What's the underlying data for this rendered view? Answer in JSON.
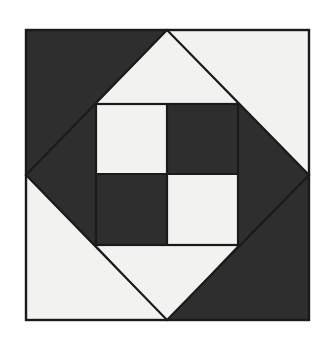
{
  "figure": {
    "title": "Square-in-a-Square Quilt Block with Four-Patch Center",
    "canvas": {
      "width": 331,
      "height": 345,
      "background": "#ffffff"
    }
  },
  "palette": {
    "dark": "#2e2e2e",
    "light": "#f2f2f0",
    "outline": "#1a1a1a",
    "background": "#ffffff"
  },
  "geometry": {
    "outer_square": {
      "left": 26,
      "top": 30,
      "right": 309,
      "bottom": 320
    },
    "diamond_points": {
      "top": "167,30",
      "right": "309,175",
      "bottom": "167,320",
      "left": "26,175"
    },
    "inner_square": {
      "left": 96,
      "top": 104,
      "right": 238,
      "bottom": 245
    },
    "inner_center": {
      "x": 167,
      "y": 174
    },
    "stroke_width": 2.2,
    "outer_stroke_width": 2.4
  },
  "shapes": {
    "corner_triangles": [
      {
        "name": "corner-triangle-top-left",
        "points": "26,30 167,30 26,175",
        "fill": "dark"
      },
      {
        "name": "corner-triangle-top-right",
        "points": "167,30 309,30 309,175",
        "fill": "light"
      },
      {
        "name": "corner-triangle-bottom-left",
        "points": "26,175 167,320 26,320",
        "fill": "light"
      },
      {
        "name": "corner-triangle-bottom-right",
        "points": "309,175 309,320 167,320",
        "fill": "dark"
      }
    ],
    "diamond": {
      "name": "center-diamond",
      "points": "167,30 309,175 167,320 26,175",
      "fill": "dark"
    },
    "diamond_wedges": [
      {
        "name": "diamond-wedge-top",
        "points": "167,30 238,104 96,104",
        "fill": "light"
      },
      {
        "name": "diamond-wedge-bottom",
        "points": "167,320 96,245 238,245",
        "fill": "light"
      }
    ],
    "four_patch": [
      {
        "name": "four-patch-cell-top-left",
        "rect": "96,104,71,70",
        "fill": "light"
      },
      {
        "name": "four-patch-cell-top-right",
        "rect": "167,104,71,70",
        "fill": "dark"
      },
      {
        "name": "four-patch-cell-bottom-left",
        "rect": "96,174,71,71",
        "fill": "dark"
      },
      {
        "name": "four-patch-cell-bottom-right",
        "rect": "167,174,71,71",
        "fill": "light"
      }
    ]
  }
}
